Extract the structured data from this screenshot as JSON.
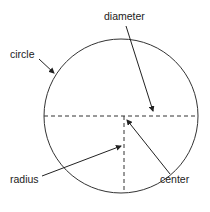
{
  "diagram": {
    "labels": {
      "circle": "circle",
      "diameter": "diameter",
      "radius": "radius",
      "center": "center"
    },
    "colors": {
      "line": "#333333",
      "text": "#222222",
      "background": "#ffffff"
    }
  }
}
